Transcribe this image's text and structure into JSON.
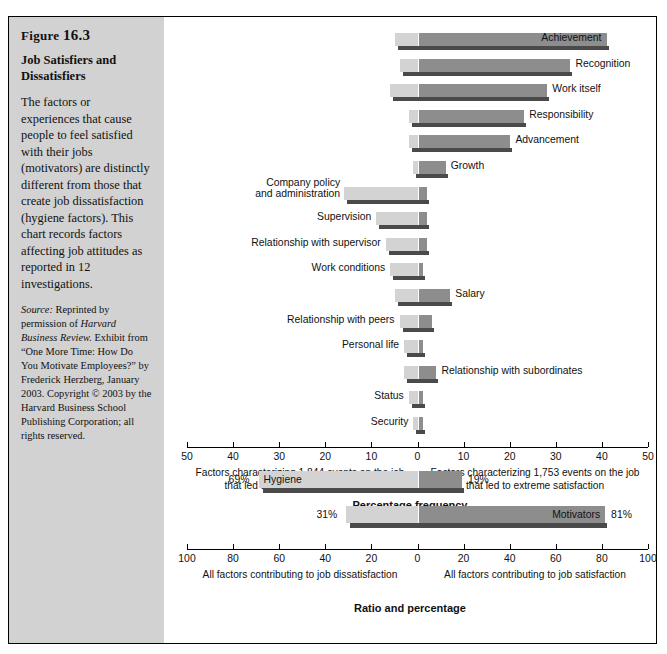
{
  "figure": {
    "number_label": "Figure",
    "number": "16.3",
    "title": "Job Satisfiers and Dissatisfiers",
    "body": "The factors or experiences that cause people to feel satisfied with their jobs (motivators) are distinctly different from those that create job dissatisfaction (hygiene factors). This chart records factors affecting job attitudes as reported in 12 investigations.",
    "source_label": "Source:",
    "source_text_1": " Reprinted by permission of ",
    "source_italic_1": "Harvard Business Review.",
    "source_text_2": " Exhibit from  “One More Time: How Do You Motivate Employees?” by Frederick Herzberg, January 2003. Copyright © 2003 by the Harvard Business School Publishing Corporation; all rights reserved."
  },
  "colors": {
    "panel_bg": "#d2d2d2",
    "bar_left": "#d3d3d3",
    "bar_right": "#8d8d8d",
    "bar_shadow": "#4a4a4a",
    "frame": "#000000"
  },
  "chart_data": [
    {
      "type": "bar",
      "orientation": "horizontal-diverging",
      "title": "Job satisfiers and dissatisfiers — percentage frequency",
      "xlabel": "Percentage frequency",
      "ylabel": "",
      "xlim": [
        -50,
        50
      ],
      "xticks": [
        50,
        40,
        30,
        20,
        10,
        0,
        10,
        20,
        30,
        40,
        50
      ],
      "grid": false,
      "left_axis_caption": "Factors characterizing 1,844 events on the job that led to extreme dissatisfaction",
      "right_axis_caption": "Factors characterizing 1,753 events on the job that led to extreme satisfaction",
      "series": [
        {
          "name": "Dissatisfaction (left)",
          "color": "#d3d3d3"
        },
        {
          "name": "Satisfaction (right)",
          "color": "#8d8d8d"
        }
      ],
      "categories": [
        "Achievement",
        "Recognition",
        "Work itself",
        "Responsibility",
        "Advancement",
        "Growth",
        "Company policy and administration",
        "Supervision",
        "Relationship with supervisor",
        "Work conditions",
        "Salary",
        "Relationship with peers",
        "Personal life",
        "Relationship with subordinates",
        "Status",
        "Security"
      ],
      "left_values": [
        5,
        4,
        6,
        2,
        2,
        1,
        16,
        9,
        7,
        6,
        5,
        4,
        3,
        3,
        2,
        1
      ],
      "right_values": [
        41,
        33,
        28,
        23,
        20,
        6,
        2,
        2,
        2,
        1,
        7,
        3,
        1,
        4,
        1,
        1
      ],
      "label_inside": [
        true,
        false,
        false,
        false,
        false,
        false,
        false,
        false,
        false,
        false,
        false,
        false,
        false,
        false,
        false,
        false
      ]
    },
    {
      "type": "bar",
      "orientation": "horizontal-diverging",
      "title": "Ratio and percentage",
      "xlabel": "Ratio and percentage",
      "xlim": [
        -100,
        100
      ],
      "xticks": [
        100,
        80,
        60,
        40,
        20,
        0,
        20,
        40,
        60,
        80,
        100
      ],
      "grid": false,
      "left_axis_caption": "All factors contributing to job dissatisfaction",
      "right_axis_caption": "All factors contributing to job satisfaction",
      "categories": [
        "Hygiene",
        "Motivators"
      ],
      "left_values": [
        69,
        31
      ],
      "right_values": [
        19,
        81
      ],
      "left_value_labels": [
        "69%",
        "31%"
      ],
      "right_value_labels": [
        "19%",
        "81%"
      ],
      "series": [
        {
          "name": "Dissatisfaction (left)",
          "color": "#d3d3d3"
        },
        {
          "name": "Satisfaction (right)",
          "color": "#8d8d8d"
        }
      ]
    }
  ]
}
